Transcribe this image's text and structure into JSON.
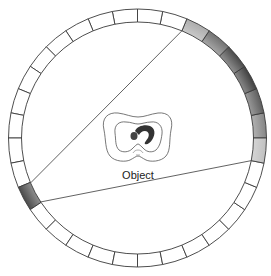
{
  "diagram": {
    "type": "ct-detector-ring",
    "object_label": "Object",
    "detector_ring": {
      "segment_count": 32,
      "segment_angle_deg": 11.25,
      "source_segment_index": 18,
      "detected_segments": [
        {
          "index": 31,
          "intensity": 0.25
        },
        {
          "index": 0,
          "intensity": 0.55
        },
        {
          "index": 1,
          "intensity": 0.75
        },
        {
          "index": 2,
          "intensity": 0.9
        },
        {
          "index": 3,
          "intensity": 0.85
        },
        {
          "index": 4,
          "intensity": 0.65
        },
        {
          "index": 5,
          "intensity": 0.35
        }
      ],
      "source_intensity": 0.85
    },
    "fan_beam": {
      "from_segment": 18,
      "to_start_angle_deg": 67.5,
      "to_end_angle_deg": -11.25
    },
    "colors": {
      "ring_fill": "#ffffff",
      "ring_stroke": "#3a3a3a",
      "shade_dark": "#2b2b2b",
      "shade_light": "#f2f2f2",
      "object_mass": "#333333"
    }
  }
}
